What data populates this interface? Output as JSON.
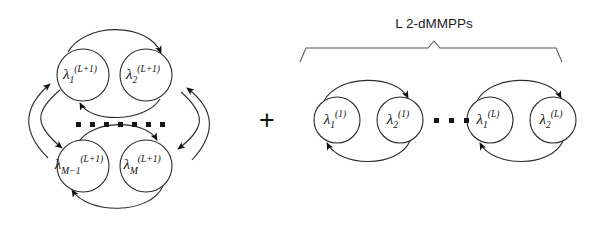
{
  "figure": {
    "operator": "+",
    "background_color": "#fefefe",
    "stroke_color": "#2b2b2b",
    "text_color": "#101010"
  },
  "left_cluster": {
    "name": "M-state MMPP ring",
    "ellipsis_dot_count": 7,
    "nodes": [
      {
        "id": "n-l-top-left",
        "base": "λ",
        "sub": "1",
        "sup": "(L+1)",
        "cx": 83,
        "cy": 75,
        "r": 26
      },
      {
        "id": "n-l-top-right",
        "base": "λ",
        "sub": "2",
        "sup": "(L+1)",
        "cx": 146,
        "cy": 75,
        "r": 26
      },
      {
        "id": "n-l-bot-left",
        "base": "λ",
        "sub": "M−1",
        "sup": "(L+1)",
        "cx": 83,
        "cy": 166,
        "r": 26
      },
      {
        "id": "n-l-bot-right",
        "base": "λ",
        "sub": "M",
        "sup": "(L+1)",
        "cx": 146,
        "cy": 166,
        "r": 26
      }
    ]
  },
  "right_cluster": {
    "name": "L 2-dMMPPs chain",
    "caption": "L 2-dMMPPs",
    "ellipsis": "▪ ▪ ▪",
    "ellipsis_dot_count": 3,
    "nodes": [
      {
        "id": "n-r-1-1",
        "base": "λ",
        "sub": "1",
        "sup": "(1)",
        "cx": 337,
        "cy": 120,
        "r": 23
      },
      {
        "id": "n-r-1-2",
        "base": "λ",
        "sub": "2",
        "sup": "(1)",
        "cx": 400,
        "cy": 120,
        "r": 23
      },
      {
        "id": "n-r-L-1",
        "base": "λ",
        "sub": "1",
        "sup": "(L)",
        "cx": 490,
        "cy": 120,
        "r": 23
      },
      {
        "id": "n-r-L-2",
        "base": "λ",
        "sub": "2",
        "sup": "(L)",
        "cx": 553,
        "cy": 120,
        "r": 23
      }
    ],
    "brace": {
      "left": 300,
      "right": 562,
      "apex_x": 434,
      "top_y": 44,
      "caption_y": 26
    }
  }
}
